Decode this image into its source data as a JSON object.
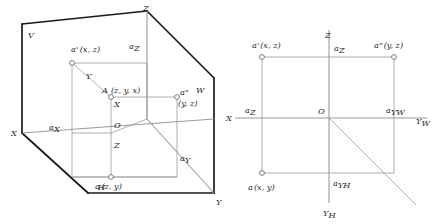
{
  "figure": {
    "stroke_colors": {
      "heavy": "#1a1a1a",
      "light": "#9a9a9a",
      "point_outline": "#6e6e6e",
      "text": "#2b2b2b",
      "background": "#ffffff"
    }
  },
  "pictorial": {
    "name": "three-plane-pictorial-view",
    "planes": [
      {
        "id": "V",
        "label": "V"
      },
      {
        "id": "H",
        "label": "H"
      },
      {
        "id": "W",
        "label": "W"
      }
    ],
    "axes": [
      {
        "id": "X",
        "label": "X"
      },
      {
        "id": "Y",
        "label": "Y"
      },
      {
        "id": "Z",
        "label": "Z"
      }
    ],
    "inner_axes": [
      {
        "id": "inner-X",
        "label": "X"
      },
      {
        "id": "inner-Y",
        "label": "Y"
      },
      {
        "id": "inner-Z",
        "label": "Z"
      },
      {
        "id": "origin",
        "label": "O"
      }
    ],
    "points": [
      {
        "id": "A",
        "label": "A",
        "coords": "(z, y, x)"
      },
      {
        "id": "a-prime",
        "label": "a'",
        "coords": "(x, z)"
      },
      {
        "id": "a-double-prime",
        "label": "a\"",
        "coords": "(y, z)"
      },
      {
        "id": "a",
        "label": "a",
        "coords": "(z, y)"
      }
    ],
    "foot_labels": [
      {
        "id": "aX",
        "base": "a",
        "sub": "X"
      },
      {
        "id": "aY",
        "base": "a",
        "sub": "Y"
      },
      {
        "id": "aZ",
        "base": "a",
        "sub": "Z"
      }
    ]
  },
  "unfolded": {
    "name": "unfolded-projection-planes-view",
    "axes": [
      {
        "id": "Z",
        "label": "Z"
      },
      {
        "id": "X",
        "label": "X"
      },
      {
        "id": "YW",
        "base": "Y",
        "sub": "W"
      },
      {
        "id": "YH",
        "base": "Y",
        "sub": "H"
      }
    ],
    "origin": {
      "id": "origin",
      "label": "O"
    },
    "points": [
      {
        "id": "a-prime",
        "label": "a'",
        "coords": "(x, z)"
      },
      {
        "id": "a-double-prime",
        "label": "a\"",
        "coords": "(y, z)"
      },
      {
        "id": "a",
        "label": "a",
        "coords": "(x, y)"
      }
    ],
    "foot_labels": [
      {
        "id": "aZ-top",
        "base": "a",
        "sub": "Z"
      },
      {
        "id": "aZ-left",
        "base": "a",
        "sub": "Z"
      },
      {
        "id": "aYW",
        "base": "a",
        "sub": "YW"
      },
      {
        "id": "aYH",
        "base": "a",
        "sub": "YH"
      }
    ]
  }
}
